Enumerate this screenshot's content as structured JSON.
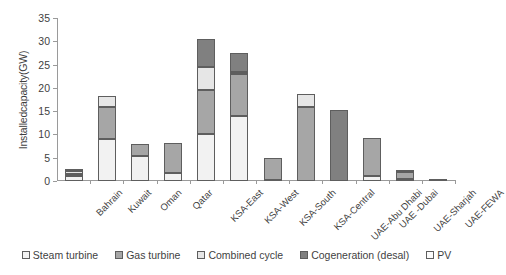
{
  "chart_data": {
    "type": "bar",
    "stacked": true,
    "title": "",
    "xlabel": "",
    "ylabel": "Installedcapacity(GW)",
    "ylim": [
      0,
      35
    ],
    "yticks": [
      0,
      5,
      10,
      15,
      20,
      25,
      30,
      35
    ],
    "grid": false,
    "legend_position": "bottom",
    "categories": [
      "Bahrain",
      "Kuwait",
      "Oman",
      "Qatar",
      "KSA-East",
      "KSA-West",
      "KSA-South",
      "KSA-Central",
      "UAE-Abu Dhabi",
      "UAE -Dubai",
      "UAE-Sharjah",
      "UAE-FEWA"
    ],
    "series": [
      {
        "name": "Steam turbine",
        "color": "#f2f2f2",
        "values": [
          1.1,
          9.0,
          5.4,
          1.8,
          10.0,
          14.0,
          0.3,
          0.0,
          0.0,
          1.1,
          0.5,
          0.1
        ]
      },
      {
        "name": "Gas turbine",
        "color": "#a6a6a6",
        "values": [
          0.5,
          7.0,
          2.5,
          6.3,
          9.5,
          9.0,
          4.6,
          16.0,
          0.0,
          8.2,
          1.4,
          0.4
        ]
      },
      {
        "name": "Combined cycle",
        "color": "#e6e6e6",
        "values": [
          0.5,
          2.3,
          0.0,
          0.0,
          5.0,
          0.5,
          0.0,
          2.7,
          0.0,
          0.0,
          0.0,
          0.0
        ]
      },
      {
        "name": "Cogeneration (desal)",
        "color": "#808080",
        "values": [
          0.4,
          0.0,
          0.0,
          0.0,
          6.0,
          4.0,
          0.0,
          0.0,
          15.3,
          0.0,
          0.3,
          0.0
        ]
      },
      {
        "name": "PV",
        "color": "#fbfbfb",
        "values": [
          0.0,
          0.0,
          0.0,
          0.0,
          0.0,
          0.0,
          0.0,
          0.0,
          0.0,
          0.0,
          0.0,
          0.0
        ]
      }
    ],
    "totals": [
      2.5,
      18.3,
      7.9,
      8.1,
      30.5,
      27.5,
      4.9,
      18.7,
      15.3,
      9.3,
      2.2,
      0.5
    ]
  },
  "legend": {
    "items": [
      {
        "label": "Steam turbine"
      },
      {
        "label": "Gas turbine"
      },
      {
        "label": "Combined cycle"
      },
      {
        "label": "Cogeneration (desal)"
      },
      {
        "label": "PV"
      }
    ]
  }
}
